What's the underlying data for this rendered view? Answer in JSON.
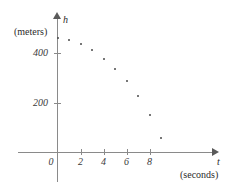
{
  "chart_data": {
    "type": "scatter",
    "title": "",
    "xlabel": "t",
    "xunit": "(seconds)",
    "ylabel": "h",
    "yunit": "(meters)",
    "xlim": [
      -0.7,
      12.0
    ],
    "ylim": [
      0,
      560
    ],
    "grid": false,
    "legend": null,
    "xticks": [
      2,
      4,
      6,
      8
    ],
    "xticklabels": [
      "2",
      "4",
      "6",
      "8"
    ],
    "yticks": [
      200,
      400
    ],
    "yticklabels": [
      "200",
      "400"
    ],
    "origin_label": "0",
    "x": [
      0,
      1,
      2,
      3,
      4,
      5,
      6,
      7,
      8,
      9
    ],
    "y": [
      460,
      450,
      435,
      410,
      375,
      335,
      285,
      225,
      150,
      60
    ],
    "points": [
      {
        "t": 0,
        "h": 460
      },
      {
        "t": 1,
        "h": 450
      },
      {
        "t": 2,
        "h": 435
      },
      {
        "t": 3,
        "h": 410
      },
      {
        "t": 4,
        "h": 375
      },
      {
        "t": 5,
        "h": 335
      },
      {
        "t": 6,
        "h": 285
      },
      {
        "t": 7,
        "h": 225
      },
      {
        "t": 8,
        "h": 150
      },
      {
        "t": 9,
        "h": 60
      }
    ],
    "colors": {
      "axis": "#8a8a8a",
      "point": "#4a4a4a",
      "text": "#2b2b2b"
    }
  }
}
